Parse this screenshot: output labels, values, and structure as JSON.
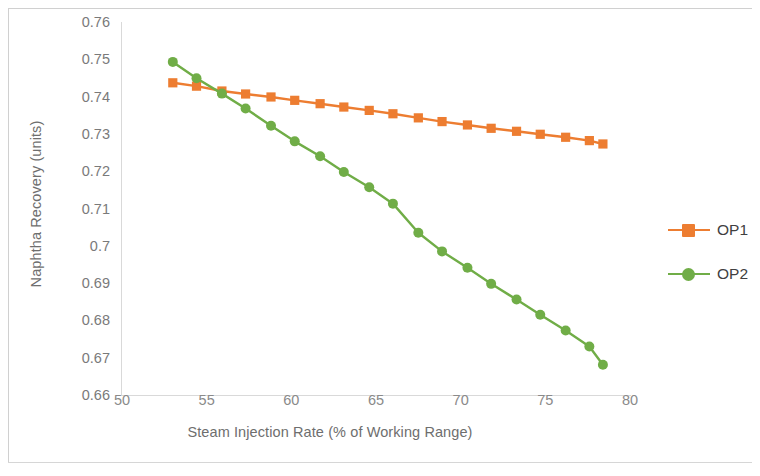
{
  "chart_data": {
    "type": "line",
    "title": "",
    "xlabel": "Steam Injection Rate (% of Working Range)",
    "ylabel": "Naphtha Recovery (units)",
    "xlim": [
      50,
      80
    ],
    "ylim": [
      0.66,
      0.76
    ],
    "xticks": [
      50,
      55,
      60,
      65,
      70,
      75,
      80
    ],
    "yticks": [
      "0.66",
      "0.67",
      "0.68",
      "0.69",
      "0.7",
      "0.71",
      "0.72",
      "0.73",
      "0.74",
      "0.75",
      "0.76"
    ],
    "grid": false,
    "legend_position": "right",
    "x": [
      53.0,
      54.4,
      55.9,
      57.3,
      58.8,
      60.2,
      61.7,
      63.1,
      64.6,
      66.0,
      67.5,
      68.9,
      70.4,
      71.8,
      73.3,
      74.7,
      76.2,
      77.6,
      78.4
    ],
    "series": [
      {
        "name": "OP1",
        "color": "#ED7D31",
        "marker": "square",
        "values": [
          0.7437,
          0.7428,
          0.7415,
          0.7407,
          0.7399,
          0.739,
          0.7381,
          0.7372,
          0.7363,
          0.7354,
          0.7343,
          0.7333,
          0.7324,
          0.7315,
          0.7307,
          0.7299,
          0.7291,
          0.7282,
          0.7273
        ]
      },
      {
        "name": "OP2",
        "color": "#70AD47",
        "marker": "circle",
        "values": [
          0.7493,
          0.7449,
          0.7408,
          0.7368,
          0.7322,
          0.728,
          0.724,
          0.7198,
          0.7157,
          0.7113,
          0.7035,
          0.6985,
          0.6941,
          0.6898,
          0.6856,
          0.6815,
          0.6773,
          0.673,
          0.6681
        ]
      }
    ],
    "series_note_op2_extra": [
      0.7075
    ]
  },
  "legend": {
    "items": [
      {
        "label": "OP1"
      },
      {
        "label": "OP2"
      }
    ]
  },
  "axes": {
    "x_title": "Steam Injection Rate (% of Working Range)",
    "y_title": "Naphtha Recovery (units)"
  },
  "colors": {
    "op1": "#ED7D31",
    "op2": "#70AD47",
    "axis": "#d9d9d9",
    "tick_text": "#7a7a7a",
    "title_text": "#6e6e6e"
  }
}
